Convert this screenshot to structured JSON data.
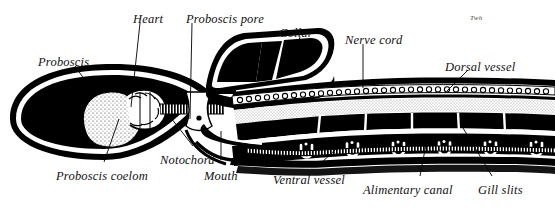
{
  "figure": {
    "background_color": "#ffffff",
    "ink_color": "#000000",
    "signature": "Twh"
  },
  "labels": [
    {
      "id": "proboscis",
      "text": "Proboscis",
      "x": 38,
      "y": 55,
      "align": "left"
    },
    {
      "id": "heart",
      "text": "Heart",
      "x": 133,
      "y": 12,
      "align": "left"
    },
    {
      "id": "proboscis-pore",
      "text": "Proboscis pore",
      "x": 186,
      "y": 12,
      "align": "left"
    },
    {
      "id": "collar",
      "text": "Collar",
      "x": 279,
      "y": 26,
      "align": "left"
    },
    {
      "id": "nerve-cord",
      "text": "Nerve cord",
      "x": 345,
      "y": 33,
      "align": "left"
    },
    {
      "id": "dorsal-vessel",
      "text": "Dorsal vessel",
      "x": 445,
      "y": 60,
      "align": "left"
    },
    {
      "id": "proboscis-coelom",
      "text": "Proboscis coelom",
      "x": 56,
      "y": 169,
      "align": "left"
    },
    {
      "id": "notochord",
      "text": "Notochord",
      "x": 160,
      "y": 153,
      "align": "left"
    },
    {
      "id": "mouth",
      "text": "Mouth",
      "x": 204,
      "y": 169,
      "align": "left"
    },
    {
      "id": "ventral-vessel",
      "text": "Ventral vessel",
      "x": 273,
      "y": 173,
      "align": "left"
    },
    {
      "id": "alimentary-canal",
      "text": "Alimentary canal",
      "x": 363,
      "y": 183,
      "align": "left"
    },
    {
      "id": "gill-slits",
      "text": "Gill slits",
      "x": 478,
      "y": 183,
      "align": "left"
    }
  ],
  "leaders": [
    {
      "id": "leader-proboscis",
      "d": "M 75 66 L 96 96"
    },
    {
      "id": "leader-heart",
      "d": "M 140 23 L 131 107"
    },
    {
      "id": "leader-proboscis-pore",
      "d": "M 192 23 L 190 119"
    },
    {
      "id": "leader-collar",
      "d": "M 300 37 L 292 62"
    },
    {
      "id": "leader-nerve-cord",
      "d": "M 363 44 L 363 88"
    },
    {
      "id": "leader-dorsal-vessel",
      "d": "M 468 70 L 447 91"
    },
    {
      "id": "leader-proboscis-coelom",
      "d": "M 104 162 L 119 119"
    },
    {
      "id": "leader-notochord",
      "d": "M 193 146 L 171 118"
    },
    {
      "id": "leader-mouth",
      "d": "M 221 160 L 221 131"
    },
    {
      "id": "leader-ventral-vessel",
      "d": "M 318 166 L 337 148"
    },
    {
      "id": "leader-alimentary-canal",
      "d": "M 420 176 L 428 134"
    },
    {
      "id": "leader-gill-slits",
      "d": "M 492 176 L 460 123"
    }
  ],
  "anatomy": {
    "parts": [
      {
        "name": "proboscis-body",
        "description": "large solid black teardrop at left"
      },
      {
        "name": "proboscis-coelom",
        "description": "stippled oval cavity inside proboscis"
      },
      {
        "name": "heart",
        "description": "scalloped crescent chamber above coelom"
      },
      {
        "name": "proboscis-pore",
        "description": "opening at base of proboscis stalk"
      },
      {
        "name": "collar",
        "description": "black segmented block with white dividers"
      },
      {
        "name": "nerve-cord",
        "description": "chain of small circles along dorsal side"
      },
      {
        "name": "dorsal-vessel",
        "description": "dark band beneath nerve cord"
      },
      {
        "name": "notochord",
        "description": "hatched narrow rod behind heart"
      },
      {
        "name": "mouth",
        "description": "ventral opening below collar"
      },
      {
        "name": "alimentary-canal",
        "description": "segmented black tube through trunk"
      },
      {
        "name": "ventral-vessel",
        "description": "hatched ladder band along ventral side"
      },
      {
        "name": "gill-slits",
        "description": "row of six U-shaped openings"
      }
    ],
    "gill_slit_count": 6,
    "nerve_cord_circle_count": 34
  }
}
